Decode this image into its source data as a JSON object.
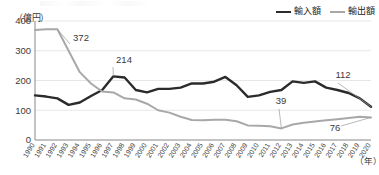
{
  "chart_data": {
    "type": "line",
    "title": "",
    "xlabel": "年",
    "ylabel": "億円",
    "ylim": [
      0,
      400
    ],
    "yticks": [
      0,
      100,
      200,
      300,
      400
    ],
    "grid": true,
    "legend_position": "top-right",
    "x": [
      1990,
      1991,
      1992,
      1993,
      1994,
      1995,
      1996,
      1997,
      1998,
      1999,
      2000,
      2001,
      2002,
      2003,
      2004,
      2005,
      2006,
      2007,
      2008,
      2009,
      2010,
      2011,
      2012,
      2013,
      2014,
      2015,
      2016,
      2017,
      2018,
      2019,
      2020
    ],
    "categories": [
      "1990",
      "1991",
      "1992",
      "1993",
      "1994",
      "1995",
      "1996",
      "1997",
      "1998",
      "1999",
      "2000",
      "2001",
      "2002",
      "2003",
      "2004",
      "2005",
      "2006",
      "2007",
      "2008",
      "2009",
      "2010",
      "2011",
      "2012",
      "2013",
      "2014",
      "2015",
      "2016",
      "2017",
      "2018",
      "2019",
      "2020"
    ],
    "series": [
      {
        "name": "輸入額",
        "color": "#2b2b2b",
        "values": [
          150,
          146,
          140,
          118,
          126,
          148,
          168,
          214,
          210,
          168,
          160,
          172,
          172,
          176,
          190,
          190,
          196,
          212,
          184,
          145,
          150,
          162,
          168,
          197,
          192,
          197,
          176,
          168,
          158,
          140,
          112
        ]
      },
      {
        "name": "輸出額",
        "color": "#a8a8a8",
        "values": [
          370,
          372,
          372,
          300,
          228,
          190,
          163,
          160,
          140,
          136,
          122,
          100,
          92,
          78,
          67,
          66,
          68,
          68,
          63,
          49,
          48,
          46,
          39,
          52,
          58,
          62,
          66,
          70,
          74,
          78,
          76
        ]
      }
    ],
    "annotations": [
      {
        "label": "372",
        "series": "輸出額",
        "year": 1992,
        "value": 372
      },
      {
        "label": "214",
        "series": "輸入額",
        "year": 1997,
        "value": 214
      },
      {
        "label": "39",
        "series": "輸出額",
        "year": 2012,
        "value": 39
      },
      {
        "label": "112",
        "series": "輸入額",
        "year": 2020,
        "value": 112
      },
      {
        "label": "76",
        "series": "輸出額",
        "year": 2020,
        "value": 76
      }
    ]
  },
  "axis": {
    "unit_y": "（億円）",
    "unit_x": "（年）"
  },
  "legend": {
    "items": [
      {
        "label": "輸入額"
      },
      {
        "label": "輸出額"
      }
    ]
  }
}
